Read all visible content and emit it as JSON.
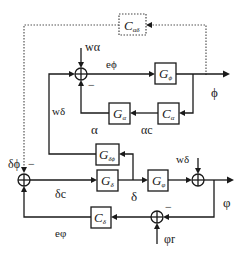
{
  "diagram": {
    "blocks": {
      "c_alpha_delta": {
        "label": "C",
        "sub": "αδ",
        "style": "dotted"
      },
      "g_phi": {
        "label": "G",
        "sub": "ϕ"
      },
      "c_alpha": {
        "label": "C",
        "sub": "α"
      },
      "g_alpha": {
        "label": "G",
        "sub": "α"
      },
      "g_delta_phi": {
        "label": "G",
        "sub": "δϕ"
      },
      "g_delta": {
        "label": "G",
        "sub": "δ"
      },
      "g_varphi": {
        "label": "G",
        "sub": "φ"
      },
      "c_delta": {
        "label": "C",
        "sub": "δ"
      }
    },
    "signals": {
      "w_alpha": "wα",
      "e_phi": "eϕ",
      "phi": "ϕ",
      "w_delta_left": "wδ",
      "alpha": "α",
      "alpha_c": "αc",
      "delta_phi": "δϕ",
      "delta_c": "δc",
      "delta": "δ",
      "w_delta_right": "wδ",
      "varphi": "φ",
      "e_varphi": "eφ",
      "varphi_r": "φr"
    },
    "signs": {
      "minus": "−"
    }
  }
}
